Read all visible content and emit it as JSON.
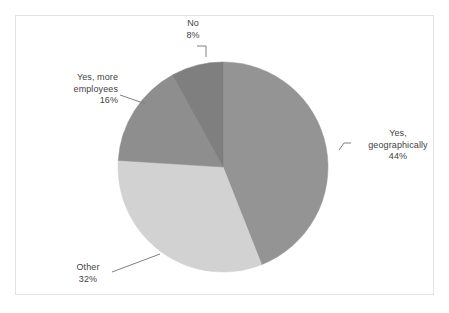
{
  "figure": {
    "background_color": "#ffffff",
    "frame_border_color": "#e2e2e2",
    "label_text_color": "#3f3f3f",
    "leader_line_color": "#808080"
  },
  "chart_data": {
    "type": "pie",
    "title": "",
    "subtitle": "",
    "xlabel": "",
    "ylabel": "",
    "legend_position": "none",
    "grid": false,
    "labels_show_percent": true,
    "start_angle_deg": 0,
    "direction": "clockwise",
    "categories": [
      "Yes, geographically",
      "Other",
      "Yes, more employees",
      "No"
    ],
    "values": [
      44,
      32,
      16,
      8
    ],
    "units": "%",
    "slices": [
      {
        "label": "Yes, geographically",
        "label_line1": "Yes,",
        "label_line2": "geographically",
        "value": 44,
        "value_text": "44%",
        "color": "#949494",
        "start_deg": 0,
        "end_deg": 158.4
      },
      {
        "label": "Other",
        "label_line1": "Other",
        "label_line2": "",
        "value": 32,
        "value_text": "32%",
        "color": "#d2d2d2",
        "start_deg": 158.4,
        "end_deg": 273.6
      },
      {
        "label": "Yes, more employees",
        "label_line1": "Yes, more",
        "label_line2": "employees",
        "value": 16,
        "value_text": "16%",
        "color": "#8e8e8e",
        "start_deg": 273.6,
        "end_deg": 331.2
      },
      {
        "label": "No",
        "label_line1": "No",
        "label_line2": "",
        "value": 8,
        "value_text": "8%",
        "color": "#7f7f7f",
        "start_deg": 331.2,
        "end_deg": 360
      }
    ]
  }
}
